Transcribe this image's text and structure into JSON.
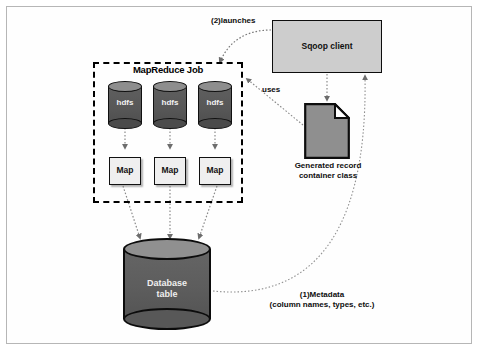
{
  "figure": {
    "background": "#ffffff",
    "frame_color": "#b6b6b6"
  },
  "nodes": {
    "mapreduce_job": {
      "label": "MapReduce Job",
      "border_style": "dashed",
      "border_color": "#000000"
    },
    "hdfs_stores": [
      {
        "label": "hdfs"
      },
      {
        "label": "hdfs"
      },
      {
        "label": "hdfs"
      }
    ],
    "mappers": [
      {
        "label": "Map"
      },
      {
        "label": "Map"
      },
      {
        "label": "Map"
      }
    ],
    "sqoop_client": {
      "label": "Sqoop client",
      "fill": "#cdcdcd"
    },
    "generated_record": {
      "label_line1": "Generated record",
      "label_line2": "container class",
      "fill": "#8f8f8f"
    },
    "database": {
      "label_line1": "Database",
      "label_line2": "table",
      "fill": "#5d5d5d"
    }
  },
  "edges": {
    "launches": {
      "label": "(2)launches",
      "from": "sqoop-client",
      "to": "mapreduce-job"
    },
    "uses": {
      "label": "uses",
      "from": "generated-record-container-class",
      "to": "mapreduce-job"
    },
    "metadata": {
      "label_line1": "(1)Metadata",
      "label_line2": "(column names, types, etc.)",
      "from": "database-table",
      "to": "sqoop-client"
    },
    "sqoop_to_record": {
      "from": "sqoop-client",
      "to": "generated-record-container-class"
    },
    "hdfs_to_map": {
      "from": "hdfs-store",
      "to": "mapper"
    },
    "map_to_database": {
      "from": "mapper",
      "to": "database-table"
    }
  }
}
